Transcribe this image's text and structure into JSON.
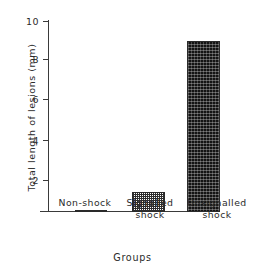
{
  "chart_data": {
    "type": "bar",
    "title": "",
    "categories": [
      "Non-shock",
      "Signalled shock",
      "Unsignalled shock"
    ],
    "values": [
      0.45,
      1.45,
      9.05
    ],
    "xlabel": "Groups",
    "ylabel": "Total length of lesions (mm)",
    "ylim": [
      0,
      10
    ],
    "ytick_labels": [
      "10",
      "8",
      "6",
      "4",
      "2"
    ],
    "ytick_values": [
      10,
      8,
      6,
      4,
      2
    ],
    "grid": false,
    "legend": "none",
    "bar_styles": [
      "open",
      "medium-stipple",
      "dense-stipple"
    ],
    "category_lines": [
      [
        "Non-shock"
      ],
      [
        "Signalled",
        "shock"
      ],
      [
        "Unsignalled",
        "shock"
      ]
    ]
  },
  "colors": {
    "axis": "#3a3a3a",
    "text": "#2b2b2b",
    "bar_open_fill": "#ffffff",
    "bar_medium_fill": "#2e2e2e",
    "bar_dense_fill": "#141414",
    "background": "#ffffff"
  }
}
